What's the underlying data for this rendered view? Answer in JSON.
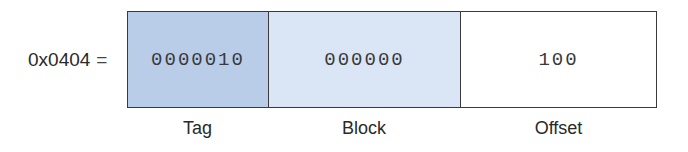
{
  "diagram": {
    "address": {
      "value": "0x0404",
      "equals": "="
    },
    "fields": [
      {
        "name": "tag",
        "bits": "0000010",
        "label": "Tag",
        "color": "#b9cde9"
      },
      {
        "name": "block",
        "bits": "000000",
        "label": "Block",
        "color": "#dae6f6"
      },
      {
        "name": "offset",
        "bits": "100",
        "label": "Offset",
        "color": "#ffffff"
      }
    ]
  }
}
